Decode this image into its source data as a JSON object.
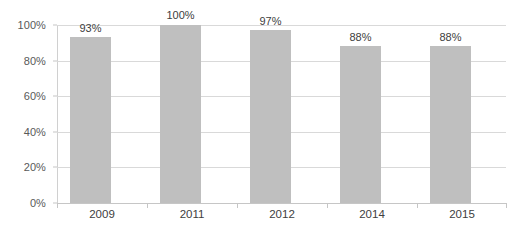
{
  "chart_data": {
    "type": "bar",
    "title": "",
    "subtitle": "",
    "xlabel": "",
    "ylabel": "",
    "categories": [
      "2009",
      "2011",
      "2012",
      "2014",
      "2015"
    ],
    "values": [
      93,
      100,
      97,
      88,
      88
    ],
    "data_labels": [
      "93%",
      "100%",
      "97%",
      "88%",
      "88%"
    ],
    "ylim": [
      0,
      100
    ],
    "y_ticks": [
      0,
      20,
      40,
      60,
      80,
      100
    ],
    "y_tick_labels": [
      "0%",
      "20%",
      "40%",
      "60%",
      "80%",
      "100%"
    ],
    "grid": true,
    "legend": false,
    "legend_position": "none",
    "bar_color": "#bfbfbf",
    "gridline_color": "#d9d9d9",
    "axis_color": "#c6c6c6",
    "label_color": "#404040",
    "tick_label_color": "#595959",
    "background_color": "#ffffff"
  }
}
